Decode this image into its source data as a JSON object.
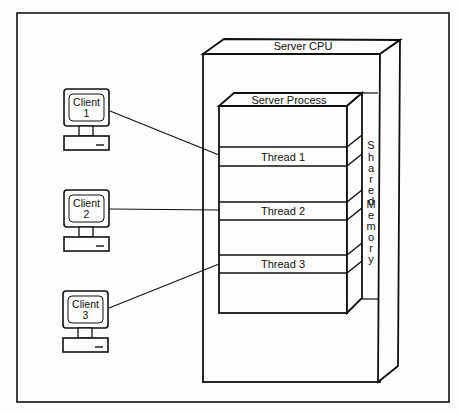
{
  "diagram": {
    "colors": {
      "line": "#111111",
      "background": "#fdfdfc"
    },
    "server_cpu": {
      "label": "Server CPU"
    },
    "server_process": {
      "label": "Server Process"
    },
    "shared_memory": {
      "label": "Shared Memory",
      "letters": [
        "S",
        "h",
        "a",
        "r",
        "e",
        "d",
        "",
        "M",
        "e",
        "m",
        "o",
        "r",
        "y"
      ]
    },
    "threads": [
      {
        "label": "Thread 1"
      },
      {
        "label": "Thread 2"
      },
      {
        "label": "Thread 3"
      }
    ],
    "clients": [
      {
        "line1": "Client",
        "line2": "1",
        "connects_to": "Thread 1"
      },
      {
        "line1": "Client",
        "line2": "2",
        "connects_to": "Thread 2"
      },
      {
        "line1": "Client",
        "line2": "3",
        "connects_to": "Thread 3"
      }
    ]
  }
}
